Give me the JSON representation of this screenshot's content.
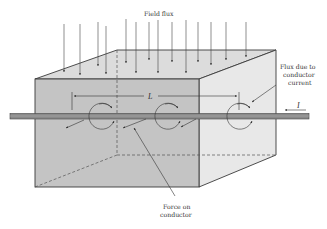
{
  "diagram": {
    "type": "physics-illustration",
    "labels": {
      "field_flux": "Field flux",
      "flux_due_line1": "Flux due to",
      "flux_due_line2": "conductor",
      "flux_due_line3": "current",
      "force_line1": "Force on",
      "force_line2": "conductor",
      "length": "L",
      "current": "I"
    },
    "colors": {
      "front_face": "#c6c6c6",
      "top_face": "#dcdcdc",
      "right_face": "#e6e6e6",
      "conductor": "#8a8a8a",
      "outline": "#3a3a3a",
      "text": "#333333"
    },
    "field_flux_arrows": 17,
    "flux_circles": 3
  }
}
